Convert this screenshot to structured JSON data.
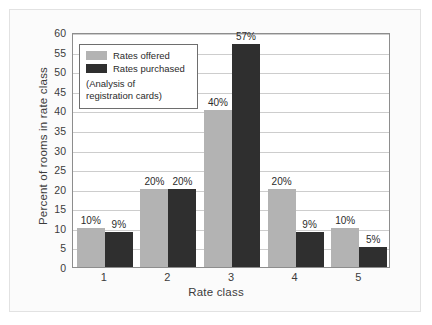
{
  "chart_data": {
    "type": "bar",
    "title": "",
    "xlabel": "Rate class",
    "ylabel": "Percent of rooms in rate class",
    "categories": [
      "1",
      "2",
      "3",
      "4",
      "5"
    ],
    "series": [
      {
        "name": "Rates offered",
        "color": "#b3b3b3",
        "values": [
          10,
          20,
          40,
          20,
          10
        ],
        "labels": [
          "10%",
          "20%",
          "40%",
          "20%",
          "10%"
        ]
      },
      {
        "name": "Rates purchased",
        "color": "#2f2f2f",
        "values": [
          9,
          20,
          57,
          9,
          5
        ],
        "labels": [
          "9%",
          "20%",
          "57%",
          "9%",
          "5%"
        ]
      }
    ],
    "ylim": [
      0,
      60
    ],
    "yticks": [
      0,
      5,
      10,
      15,
      20,
      25,
      30,
      35,
      40,
      45,
      50,
      55,
      60
    ],
    "ytick_labels": [
      "0",
      "5",
      "10",
      "15",
      "20",
      "25",
      "30",
      "35",
      "40",
      "45",
      "50",
      "55",
      "60"
    ],
    "grid": true,
    "legend_position": "upper-left",
    "annotation": "(Analysis of\nregistration cards)",
    "annotation_lines": [
      "(Analysis of",
      "registration cards)"
    ]
  },
  "legend": {
    "offered_label": "Rates offered",
    "purchased_label": "Rates purchased",
    "note_line_1": "(Analysis of",
    "note_line_2": "registration cards)"
  },
  "axes": {
    "y_title": "Percent of rooms in rate class",
    "x_title": "Rate class"
  }
}
